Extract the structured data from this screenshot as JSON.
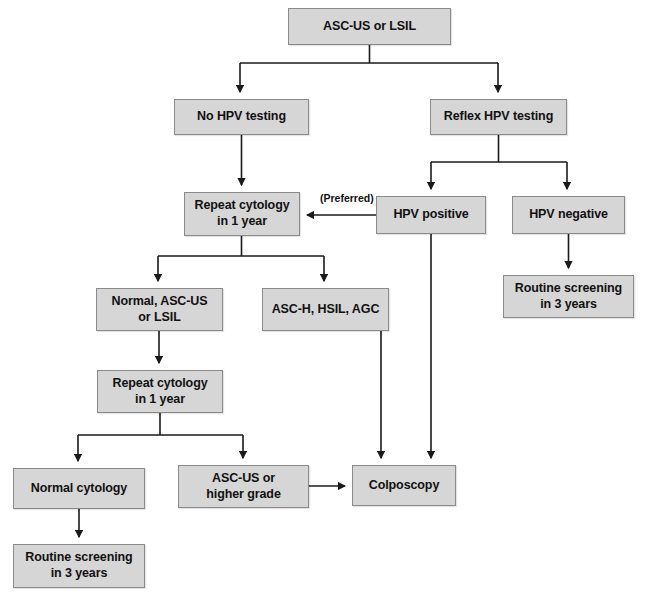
{
  "diagram": {
    "colors": {
      "node_fill": "#d6d6d6",
      "node_border": "#8a8a8a",
      "edge": "#1a1a1a",
      "background": "#ffffff"
    },
    "nodes": [
      {
        "id": "asc_us_lsil",
        "label": "ASC-US or LSIL",
        "x": 288,
        "y": 8,
        "w": 163,
        "h": 37
      },
      {
        "id": "no_hpv_testing",
        "label": "No HPV testing",
        "x": 174,
        "y": 99,
        "w": 135,
        "h": 36
      },
      {
        "id": "reflex_hpv_testing",
        "label": "Reflex HPV testing",
        "x": 430,
        "y": 99,
        "w": 137,
        "h": 36
      },
      {
        "id": "repeat_cytology_1",
        "label": "Repeat cytology\nin 1 year",
        "x": 184,
        "y": 192,
        "w": 116,
        "h": 44
      },
      {
        "id": "hpv_positive",
        "label": "HPV positive",
        "x": 376,
        "y": 196,
        "w": 110,
        "h": 38
      },
      {
        "id": "hpv_negative",
        "label": "HPV negative",
        "x": 512,
        "y": 196,
        "w": 113,
        "h": 38
      },
      {
        "id": "routine_3y_right",
        "label": "Routine screening\nin 3 years",
        "x": 503,
        "y": 275,
        "w": 131,
        "h": 43
      },
      {
        "id": "normal_ascus_lsil",
        "label": "Normal, ASC-US\nor LSIL",
        "x": 96,
        "y": 288,
        "w": 127,
        "h": 43
      },
      {
        "id": "asch_hsil_agc",
        "label": "ASC-H, HSIL, AGC",
        "x": 262,
        "y": 288,
        "w": 127,
        "h": 43
      },
      {
        "id": "repeat_cytology_2",
        "label": "Repeat cytology\nin 1 year",
        "x": 97,
        "y": 370,
        "w": 126,
        "h": 43
      },
      {
        "id": "normal_cytology",
        "label": "Normal cytology",
        "x": 13,
        "y": 468,
        "w": 132,
        "h": 41
      },
      {
        "id": "ascus_higher",
        "label": "ASC-US or\nhigher grade",
        "x": 178,
        "y": 465,
        "w": 131,
        "h": 43
      },
      {
        "id": "colposcopy",
        "label": "Colposcopy",
        "x": 352,
        "y": 465,
        "w": 104,
        "h": 41
      },
      {
        "id": "routine_3y_left",
        "label": "Routine screening\nin 3 years",
        "x": 13,
        "y": 544,
        "w": 132,
        "h": 44
      }
    ],
    "edge_labels": [
      {
        "id": "preferred",
        "text": "(Preferred)",
        "x": 320,
        "y": 192
      }
    ]
  }
}
